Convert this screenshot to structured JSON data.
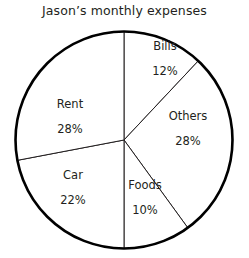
{
  "chart_data": {
    "type": "pie",
    "title": "Jason’s monthly expenses",
    "categories": [
      "Bills",
      "Others",
      "Foods",
      "Car",
      "Rent"
    ],
    "values": [
      12,
      28,
      10,
      22,
      28
    ],
    "value_labels": [
      "12%",
      "28%",
      "10%",
      "22%",
      "28%"
    ],
    "unit": "%",
    "total": 100,
    "start_angle_deg": 0,
    "direction": "clockwise",
    "legend": "none",
    "labels_position": "inside-slices",
    "slice_fill": "#ffffff",
    "outline_color": "#000000",
    "divider_color": "#231f20",
    "background": "#ffffff",
    "slices": [
      {
        "name": "Bills",
        "value": 12,
        "value_label": "12%",
        "start_deg": 0.0,
        "end_deg": 43.2
      },
      {
        "name": "Others",
        "value": 28,
        "value_label": "28%",
        "start_deg": 43.2,
        "end_deg": 144.0
      },
      {
        "name": "Foods",
        "value": 10,
        "value_label": "10%",
        "start_deg": 144.0,
        "end_deg": 180.0
      },
      {
        "name": "Car",
        "value": 22,
        "value_label": "22%",
        "start_deg": 180.0,
        "end_deg": 259.2
      },
      {
        "name": "Rent",
        "value": 28,
        "value_label": "28%",
        "start_deg": 259.2,
        "end_deg": 360.0
      }
    ]
  }
}
